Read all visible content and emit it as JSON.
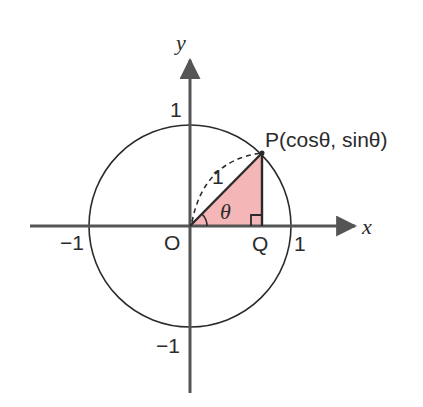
{
  "diagram": {
    "type": "unit-circle",
    "axes": {
      "x_label": "x",
      "y_label": "y",
      "ticks": {
        "x_pos": "1",
        "x_neg": "−1",
        "y_pos": "1",
        "y_neg": "−1"
      }
    },
    "points": {
      "origin": "O",
      "foot": "Q",
      "point_on_circle": "P(cosθ, sinθ)"
    },
    "hypotenuse_label": "1",
    "angle_label": "θ",
    "colors": {
      "triangle_fill": "#f4b6b6",
      "stroke": "#2b2b2b",
      "axis": "#555555"
    }
  }
}
